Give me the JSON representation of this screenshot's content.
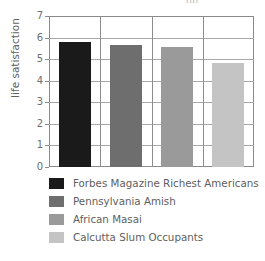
{
  "title_remnant": "pp",
  "chart_data": {
    "type": "bar",
    "title": "",
    "xlabel": "",
    "ylabel": "life satisfaction",
    "ylim": [
      0,
      7
    ],
    "ytick_step": 1,
    "yticks": [
      "7",
      "6",
      "5",
      "4",
      "3",
      "2",
      "1",
      "0"
    ],
    "grid": true,
    "legend_position": "below",
    "categories": [
      "Forbes Magazine Richest Americans",
      "Pennsylvania Amish",
      "African Masai",
      "Calcutta Slum Occupants"
    ],
    "values": [
      5.8,
      5.65,
      5.55,
      4.8
    ],
    "colors": [
      "#1a1a1a",
      "#6e6e6e",
      "#9a9a9a",
      "#c4c4c4"
    ]
  },
  "legend": {
    "items": [
      {
        "label": "Forbes Magazine Richest Americans",
        "color": "#1a1a1a"
      },
      {
        "label": "Pennsylvania Amish",
        "color": "#6e6e6e"
      },
      {
        "label": "African Masai",
        "color": "#9a9a9a"
      },
      {
        "label": "Calcutta Slum Occupants",
        "color": "#c4c4c4"
      }
    ]
  }
}
